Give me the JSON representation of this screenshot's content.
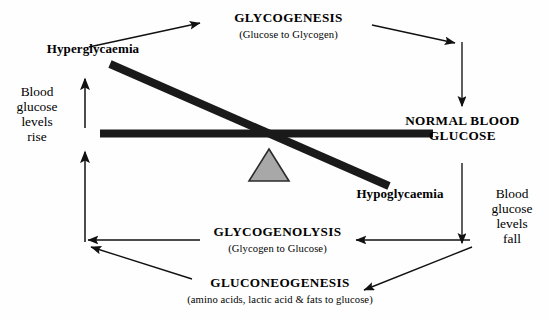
{
  "diagram": {
    "colors": {
      "ink": "#111111",
      "beam": "#1a1a1a",
      "fulcrum_fill": "#a8a8a8",
      "fulcrum_stroke": "#2b2b2b",
      "background": "#fefefe"
    },
    "nodes": {
      "glycogenesis": {
        "title": "GLYCOGENESIS",
        "subtitle": "(Glucose to Glycogen)"
      },
      "glycogenolysis": {
        "title": "GLYCOGENOLYSIS",
        "subtitle": "(Glycogen to Glucose)"
      },
      "gluconeogenesis": {
        "title": "GLUCONEOGENESIS",
        "subtitle": "(amino acids, lactic acid & fats to glucose)"
      },
      "normal_blood_glucose": {
        "line1": "NORMAL BLOOD",
        "line2": "GLUCOSE"
      },
      "hyperglycaemia": {
        "label": "Hyperglycaemia"
      },
      "hypoglycaemia": {
        "label": "Hypoglycaemia"
      },
      "levels_rise": {
        "line1": "Blood",
        "line2": "glucose",
        "line3": "levels",
        "line4": "rise"
      },
      "levels_fall": {
        "line1": "Blood",
        "line2": "glucose",
        "line3": "levels",
        "line4": "fall"
      }
    },
    "connectors": [
      {
        "name": "hyperglycaemia-to-glycogenesis",
        "from": "Hyperglycaemia",
        "to": "GLYCOGENESIS"
      },
      {
        "name": "glycogenesis-to-corner",
        "from": "GLYCOGENESIS",
        "to": "top-right corner"
      },
      {
        "name": "corner-to-normal-glucose",
        "from": "top-right corner",
        "to": "NORMAL BLOOD GLUCOSE"
      },
      {
        "name": "normal-glucose-to-lower-right",
        "from": "NORMAL BLOOD GLUCOSE",
        "to": "lower-right junction"
      },
      {
        "name": "junction-to-glycogenolysis",
        "from": "lower-right junction",
        "to": "GLYCOGENOLYSIS"
      },
      {
        "name": "junction-to-gluconeogenesis",
        "from": "lower-right junction",
        "to": "GLUCONEOGENESIS"
      },
      {
        "name": "glycogenolysis-to-left-corner",
        "from": "GLYCOGENOLYSIS",
        "to": "lower-left corner"
      },
      {
        "name": "gluconeogenesis-to-left-corner",
        "from": "GLUCONEOGENESIS",
        "to": "lower-left corner"
      },
      {
        "name": "levels-rise-lower-arrow",
        "from": "lower-left corner",
        "to": "upward"
      },
      {
        "name": "levels-rise-upper-arrow",
        "from": "left column",
        "to": "Hyperglycaemia"
      }
    ],
    "balance": {
      "beam_horizontal": "fulcrum beam (level reference)",
      "beam_tilted": "tilted beam from Hyperglycaemia down to Hypoglycaemia",
      "fulcrum": "triangular pivot"
    }
  }
}
